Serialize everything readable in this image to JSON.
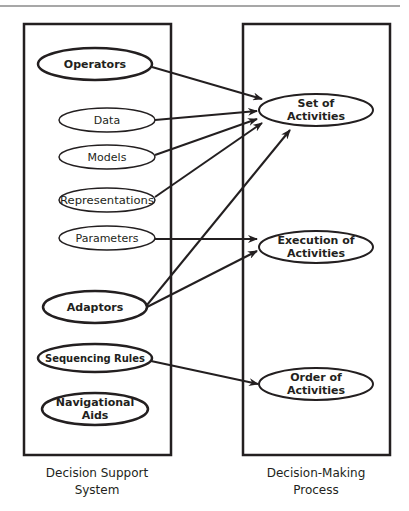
{
  "colors": {
    "stroke": "#231f20",
    "rule": "#8a8a8a",
    "background": "#ffffff"
  },
  "left_panel": {
    "caption_line1": "Decision Support",
    "caption_line2": "System",
    "nodes": [
      {
        "id": "operators",
        "label": "Operators",
        "emphasis": "bold"
      },
      {
        "id": "data",
        "label": "Data",
        "emphasis": "normal"
      },
      {
        "id": "models",
        "label": "Models",
        "emphasis": "normal"
      },
      {
        "id": "representations",
        "label": "Representations",
        "emphasis": "normal"
      },
      {
        "id": "parameters",
        "label": "Parameters",
        "emphasis": "normal"
      },
      {
        "id": "adaptors",
        "label": "Adaptors",
        "emphasis": "bold"
      },
      {
        "id": "sequencing-rules",
        "label": "Sequencing Rules",
        "emphasis": "bold"
      },
      {
        "id": "navigational-aids",
        "label_line1": "Navigational",
        "label_line2": "Aids",
        "emphasis": "bold"
      }
    ]
  },
  "right_panel": {
    "caption_line1": "Decision-Making",
    "caption_line2": "Process",
    "nodes": [
      {
        "id": "set-of-activities",
        "label_line1": "Set of",
        "label_line2": "Activities"
      },
      {
        "id": "execution-of-activities",
        "label_line1": "Execution of",
        "label_line2": "Activities"
      },
      {
        "id": "order-of-activities",
        "label_line1": "Order of",
        "label_line2": "Activities"
      }
    ]
  },
  "edges": [
    {
      "from": "operators",
      "to": "set-of-activities"
    },
    {
      "from": "data",
      "to": "set-of-activities"
    },
    {
      "from": "models",
      "to": "set-of-activities"
    },
    {
      "from": "representations",
      "to": "set-of-activities"
    },
    {
      "from": "adaptors",
      "to": "set-of-activities"
    },
    {
      "from": "parameters",
      "to": "execution-of-activities"
    },
    {
      "from": "adaptors",
      "to": "execution-of-activities"
    },
    {
      "from": "sequencing-rules",
      "to": "order-of-activities"
    }
  ]
}
